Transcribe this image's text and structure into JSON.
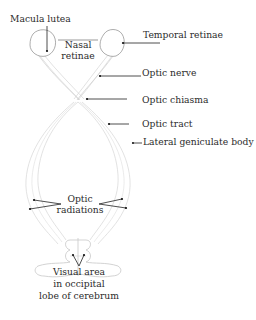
{
  "diagram": {
    "labels": {
      "macula_lutea": "Macula lutea",
      "temporal_retinae": "Temporal retinae",
      "nasal_retinae_line1": "Nasal",
      "nasal_retinae_line2": "retinae",
      "optic_nerve": "Optic nerve",
      "optic_chiasma": "Optic chiasma",
      "optic_tract": "Optic tract",
      "lateral_geniculate_body": "Lateral geniculate body",
      "optic_radiations_line1": "Optic",
      "optic_radiations_line2": "radiations",
      "visual_area_line1": "Visual area",
      "visual_area_line2": "in occipital",
      "visual_area_line3": "lobe of cerebrum"
    },
    "colors": {
      "text": "#2b2b2b",
      "leader_line": "#222222",
      "eye_outline": "#8a8a8a",
      "fibers": "#d6d6d6"
    }
  }
}
